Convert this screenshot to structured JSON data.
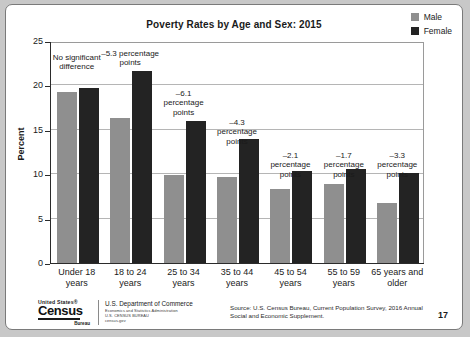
{
  "slide": {
    "page_number": "17"
  },
  "legend": {
    "items": [
      {
        "label": "Male",
        "color": "#8f8f8f"
      },
      {
        "label": "Female",
        "color": "#232323"
      }
    ]
  },
  "source_note": "Source: U.S. Census Bureau, Current Population Survey, 2016 Annual Social and Economic Supplement.",
  "logo": {
    "united_states": "United States®",
    "census": "Census",
    "bureau": "Bureau",
    "dept_line_1": "U.S. Department of Commerce",
    "dept_line_2": "Economics and Statistics Administration",
    "dept_line_3": "U.S. CENSUS BUREAU",
    "dept_line_4": "census.gov"
  },
  "chart_data": {
    "type": "bar",
    "title": "Poverty Rates by Age and Sex: 2015",
    "xlabel": "",
    "ylabel": "Percent",
    "ylim": [
      0,
      25
    ],
    "yticks": [
      0,
      5,
      10,
      15,
      20,
      25
    ],
    "ytick_labels": [
      "0",
      "5",
      "10",
      "15",
      "20",
      "25"
    ],
    "grid": true,
    "legend_position": "top-right",
    "categories": [
      "Under 18\nyears",
      "18 to 24\nyears",
      "25 to 34\nyears",
      "35 to 44\nyears",
      "45 to 54\nyears",
      "55 to 59\nyears",
      "65 years and\nolder"
    ],
    "series": [
      {
        "name": "Male",
        "color": "#8f8f8f",
        "values": [
          19.3,
          16.3,
          9.9,
          9.7,
          8.3,
          8.9,
          6.8
        ]
      },
      {
        "name": "Female",
        "color": "#232323",
        "values": [
          19.7,
          21.6,
          16.0,
          14.0,
          10.4,
          10.6,
          10.1
        ]
      }
    ],
    "annotations": [
      "No significant\ndifference",
      "–5.3 percentage\npoints",
      "–6.1\npercentage\npoints",
      "–4.3\npercentage\npoints",
      "–2.1\npercentage\npoints",
      "–1.7\npercentage\npoints",
      "–3.3\npercentage\npoints"
    ]
  }
}
